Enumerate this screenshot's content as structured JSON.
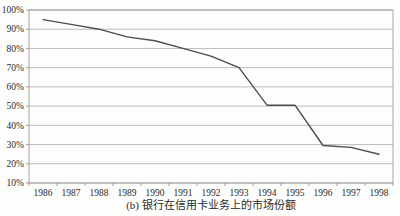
{
  "figure": {
    "caption": "(b) 银行在信用卡业务上的市场份额"
  },
  "chart_data": {
    "type": "line",
    "title": "",
    "xlabel": "",
    "ylabel": "",
    "categories": [
      "1986",
      "1987",
      "1988",
      "1989",
      "1990",
      "1991",
      "1992",
      "1993",
      "1994",
      "1995",
      "1996",
      "1997",
      "1998"
    ],
    "values": [
      95,
      92.5,
      90,
      86,
      84,
      80,
      76,
      70,
      50.5,
      50.5,
      29.5,
      28.5,
      25
    ],
    "ylim": [
      10,
      100
    ],
    "y_tick_labels": [
      "100%",
      "90%",
      "80%",
      "70%",
      "60%",
      "50%",
      "40%",
      "30%",
      "20%",
      "10%"
    ],
    "grid": true,
    "legend": "none",
    "colors": {
      "line": "#4d4d4d",
      "gridline": "#ababab",
      "border": "#9e9e9e",
      "tick": "#8a8a8a",
      "text": "#2b2b2b"
    }
  }
}
